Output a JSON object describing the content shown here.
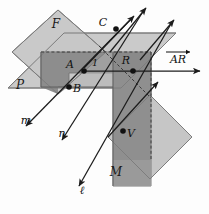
{
  "diagram": {
    "background_color": "#fdfdfd",
    "planes": [
      {
        "id": "plane-F",
        "label": "F",
        "label_x": 56,
        "label_y": 28,
        "fill": "#c9c9c9",
        "points": "58,10 106,52 58,94 12,52"
      },
      {
        "id": "plane-P",
        "label": "P",
        "label_x": 20,
        "label_y": 89,
        "fill": "#c9c9c9",
        "points": "8,88 64,33 176,33 121,88"
      },
      {
        "id": "plane-M",
        "label": "M",
        "label_x": 116,
        "label_y": 176,
        "fill": "#9a9a9a",
        "points": "113,55 151,55 151,186 113,186"
      },
      {
        "id": "plane-lower-right",
        "label": "",
        "label_x": 0,
        "label_y": 0,
        "fill": "#c4c4c4",
        "points": "150,95 192,137 150,179 108,137"
      },
      {
        "id": "plane-center-dark",
        "label": "",
        "label_x": 0,
        "label_y": 0,
        "fill": "#8f8f8f",
        "points": "41,52 148,52 148,73 89,73 89,160 41,108"
      }
    ],
    "lines": [
      {
        "id": "line-m",
        "label": "m",
        "label_x": 26,
        "label_y": 122
      },
      {
        "id": "line-n",
        "label": "n",
        "label_x": 62,
        "label_y": 136
      },
      {
        "id": "line-ell",
        "label": "ℓ",
        "label_x": 80,
        "label_y": 192
      },
      {
        "id": "ray-AR",
        "label": "AR",
        "label_x": 178,
        "label_y": 62
      }
    ],
    "points": [
      {
        "id": "point-A",
        "label": "A",
        "cx": 84,
        "cy": 71,
        "label_x": 70,
        "label_y": 68
      },
      {
        "id": "point-B",
        "label": "B",
        "cx": 69,
        "cy": 87,
        "label_x": 76,
        "label_y": 90
      },
      {
        "id": "point-C",
        "label": "C",
        "cx": 116,
        "cy": 29,
        "label_x": 102,
        "label_y": 26
      },
      {
        "id": "point-R",
        "label": "R",
        "cx": 133,
        "cy": 71,
        "label_x": 126,
        "label_y": 64
      },
      {
        "id": "point-V",
        "label": "V",
        "cx": 123,
        "cy": 131,
        "label_x": 130,
        "label_y": 137
      }
    ],
    "angles": [
      {
        "id": "angle-1",
        "label": "1",
        "label_x": 95,
        "label_y": 65
      }
    ],
    "colors": {
      "line": "#1c1c1c",
      "plane_light": "#c9c9c9",
      "plane_mid": "#b3b3b3",
      "plane_dark": "#8f8f8f",
      "outline": "#7d7d7d",
      "point": "#111111"
    }
  }
}
